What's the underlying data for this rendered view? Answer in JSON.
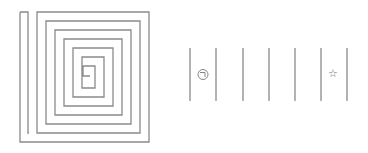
{
  "puzzle": {
    "spiral": {
      "stroke_color": "#8a8a8a"
    },
    "strip": {
      "divider_color": "#8a8a8a",
      "cells": [
        {
          "index": 0,
          "symbol": "⊝",
          "icon": "circle-corner-icon"
        },
        {
          "index": 1,
          "symbol": ""
        },
        {
          "index": 2,
          "symbol": ""
        },
        {
          "index": 3,
          "symbol": ""
        },
        {
          "index": 4,
          "symbol": ""
        },
        {
          "index": 5,
          "symbol": "☆",
          "icon": "star-icon"
        }
      ]
    }
  }
}
